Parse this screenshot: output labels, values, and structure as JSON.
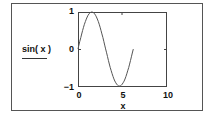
{
  "chart_data": {
    "type": "line",
    "title": "",
    "xlabel": "x",
    "ylabel": "sin(x)",
    "xlim": [
      0,
      10
    ],
    "ylim": [
      -1,
      1
    ],
    "x_ticks": [
      "0",
      "5",
      "10"
    ],
    "y_ticks": [
      "1",
      "0",
      "-1"
    ],
    "grid": false,
    "series": [
      {
        "name": "sin(x)",
        "x": [
          0,
          0.5,
          1.0,
          1.5708,
          2.0,
          2.5,
          3.0,
          3.5,
          4.0,
          4.5,
          4.7124,
          5.0,
          5.5,
          6.0,
          6.28
        ],
        "y": [
          0,
          0.479,
          0.841,
          1.0,
          0.909,
          0.598,
          0.141,
          -0.351,
          -0.757,
          -0.978,
          -1.0,
          -0.959,
          -0.706,
          -0.279,
          0
        ]
      }
    ]
  },
  "labels": {
    "function": "sin( x )",
    "x_axis": "x",
    "y_top": "1",
    "y_mid": "0",
    "y_bottom": "−1",
    "x_left": "0",
    "x_mid": "5",
    "x_right": "10"
  }
}
